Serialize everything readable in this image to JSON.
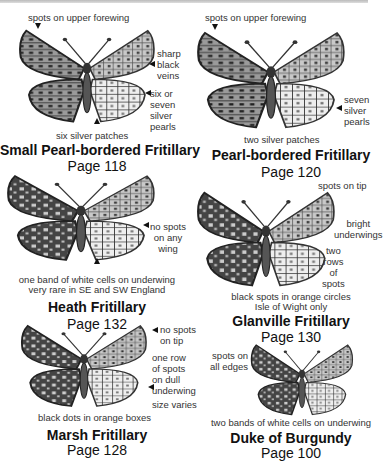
{
  "species": [
    {
      "name": "Small Pearl-bordered Fritillary",
      "page": "Page 118",
      "labels": {
        "top": "spots on upper forewing",
        "right1": "sharp\nblack\nveins",
        "right2": "six or\nseven\nsilver\npearls",
        "bottom": "six silver patches"
      }
    },
    {
      "name": "Pearl-bordered Fritillary",
      "page": "Page 120",
      "labels": {
        "top": "spots on upper forewing",
        "right1": "seven\nsilver\npearls",
        "bottom": "two silver patches"
      }
    },
    {
      "name": "Heath Fritillary",
      "page": "Page 132",
      "labels": {
        "right1": "no spots\non any\nwing",
        "bottom1": "one band of white cells on underwing",
        "bottom2": "very rare in SE and SW England"
      }
    },
    {
      "name": "Glanville Fritillary",
      "page": "Page 130",
      "labels": {
        "top": "spots on tip",
        "right1": "bright\nunderwings",
        "right2": "two\nrows\nof\nspots",
        "bottom1": "black spots in orange circles",
        "bottom2": "Isle of Wight only"
      }
    },
    {
      "name": "Marsh Fritillary",
      "page": "Page 128",
      "labels": {
        "right1": "no spots\non tip",
        "right2": "one row\nof spots\non dull\nunderwing",
        "right3": "size varies",
        "bottom": "black dots in orange boxes"
      }
    },
    {
      "name": "Duke of Burgundy",
      "page": "Page 100",
      "labels": {
        "left1": "spots on\nall edges",
        "bottom": "two bands of white cells on underwing"
      }
    }
  ],
  "colors": {
    "ink": "#111111",
    "label": "#333333",
    "wing_dark": "#3a3a3a",
    "wing_mid": "#8a8a8a",
    "wing_light": "#d8d8d8",
    "rule": "#bbbbbb"
  }
}
